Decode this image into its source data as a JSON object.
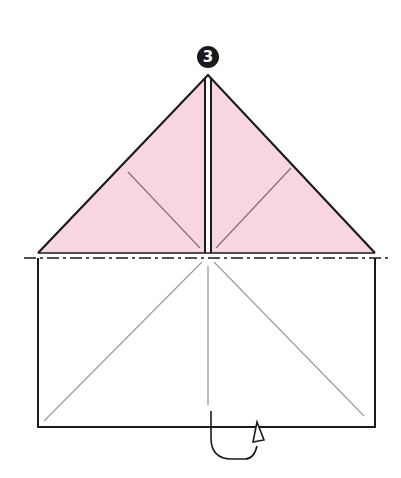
{
  "step": {
    "number": "3",
    "label": "❸"
  },
  "colors": {
    "paper_colored": "#f7d6e2",
    "paper_white": "#ffffff",
    "outline": "#1a1a1a",
    "crease": "#8a6f78",
    "crease_white": "#9a9a9a",
    "fold_line": "#1a1a1a"
  },
  "diagram": {
    "triangle_flaps": [
      "left-flap",
      "right-flap"
    ],
    "fold_line_type": "mountain-fold (dash-dot)",
    "arrow": "turn-over arrow"
  }
}
